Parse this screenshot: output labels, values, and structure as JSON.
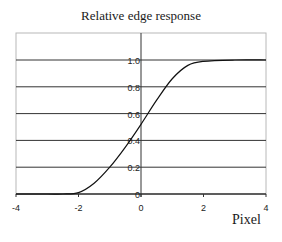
{
  "chart_data": {
    "type": "line",
    "title": "Relative edge response",
    "xlabel": "Pixel",
    "ylabel": "",
    "xlim": [
      -4,
      4
    ],
    "ylim": [
      0,
      1.2
    ],
    "x_ticks": [
      "-4",
      "-2",
      "0",
      "2",
      "4"
    ],
    "y_ticks": [
      "0",
      "0.2",
      "0.4",
      "0.6",
      "0.8",
      "1.0"
    ],
    "grid": "horizontal",
    "legend": null,
    "series": [
      {
        "name": "Relative edge response",
        "x": [
          -4,
          -3,
          -2.5,
          -2,
          -1.5,
          -1,
          -0.5,
          0,
          0.5,
          1,
          1.5,
          2,
          3,
          4
        ],
        "y": [
          0,
          0,
          0,
          0.01,
          0.08,
          0.2,
          0.35,
          0.52,
          0.7,
          0.86,
          0.96,
          0.99,
          1.0,
          1.0
        ]
      }
    ]
  }
}
